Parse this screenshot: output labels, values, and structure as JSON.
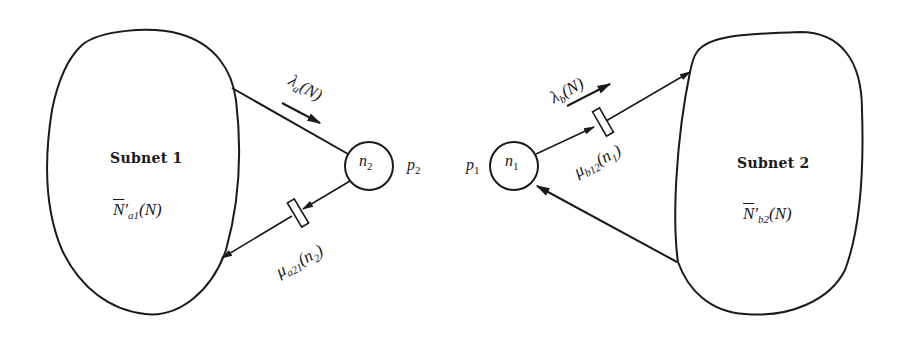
{
  "diagram": {
    "subnets": [
      {
        "id": "subnet1",
        "title": "Subnet 1",
        "population_symbol": "N",
        "population_sub": "a1",
        "population_arg": "(N)"
      },
      {
        "id": "subnet2",
        "title": "Subnet 2",
        "population_symbol": "N",
        "population_sub": "b2",
        "population_arg": "(N)"
      }
    ],
    "nodes": [
      {
        "id": "n2",
        "symbol": "n",
        "sub": "2",
        "station_symbol": "p",
        "station_sub": "2"
      },
      {
        "id": "n1",
        "symbol": "n",
        "sub": "1",
        "station_symbol": "p",
        "station_sub": "1"
      }
    ],
    "edges": [
      {
        "from": "subnet1",
        "to": "n2",
        "rate_symbol": "λ",
        "rate_sub": "a",
        "rate_arg": "(N)"
      },
      {
        "from": "n2",
        "to": "subnet1",
        "rate_symbol": "μ",
        "rate_sub": "a21",
        "rate_arg": "(n",
        "rate_arg_sub": "2",
        "rate_arg_close": ")"
      },
      {
        "from": "n1",
        "to": "subnet2",
        "rate_symbol": "λ",
        "rate_sub": "b",
        "rate_arg": "(N)",
        "server_symbol": "μ",
        "server_sub": "b12",
        "server_arg": "(n",
        "server_arg_sub": "1",
        "server_arg_close": ")"
      },
      {
        "from": "subnet2",
        "to": "n1"
      }
    ],
    "colors": {
      "stroke": "#1a1a1a",
      "background": "#ffffff"
    }
  }
}
